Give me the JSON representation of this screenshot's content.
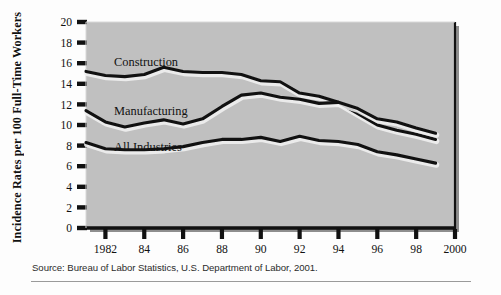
{
  "figure": {
    "background_color": "#fdfdfd",
    "plot_background_color": "#c0c0c0",
    "line_color": "#111111",
    "highlight_color": "#f2f2f2"
  },
  "y_axis": {
    "title": "Incidence Rates per 100 Full-Time Workers",
    "ticks": [
      "0",
      "2",
      "4",
      "6",
      "8",
      "10",
      "12",
      "14",
      "16",
      "18",
      "20"
    ]
  },
  "x_axis": {
    "ticks": [
      "1982",
      "84",
      "86",
      "88",
      "90",
      "92",
      "94",
      "96",
      "98",
      "2000"
    ]
  },
  "series_labels": {
    "construction": "Construction",
    "manufacturing": "Manufacturing",
    "all_industries": "All Industries"
  },
  "source": {
    "text": "Source: Bureau of Labor Statistics, U.S. Department of Labor, 2001."
  },
  "chart_data": {
    "type": "line",
    "title": "",
    "xlabel": "",
    "ylabel": "Incidence Rates per 100 Full-Time Workers",
    "xlim": [
      1981,
      2000
    ],
    "ylim": [
      0,
      20
    ],
    "ytick_step": 2,
    "xticks": [
      1982,
      1984,
      1986,
      1988,
      1990,
      1992,
      1994,
      1996,
      1998,
      2000
    ],
    "xtick_labels": [
      "1982",
      "84",
      "86",
      "88",
      "90",
      "92",
      "94",
      "96",
      "98",
      "2000"
    ],
    "grid": false,
    "legend": "inline-labels",
    "x": [
      1981,
      1982,
      1983,
      1984,
      1985,
      1986,
      1987,
      1988,
      1989,
      1990,
      1991,
      1992,
      1993,
      1994,
      1995,
      1996,
      1997,
      1998,
      1999
    ],
    "series": [
      {
        "name": "Construction",
        "label_position": "above-line-left",
        "values": [
          15.2,
          14.8,
          14.7,
          14.9,
          15.6,
          15.2,
          15.1,
          15.1,
          14.9,
          14.3,
          14.2,
          13.1,
          12.8,
          12.2,
          11.1,
          10.0,
          9.5,
          9.1,
          8.6
        ]
      },
      {
        "name": "Manufacturing",
        "label_position": "above-line-left",
        "values": [
          11.4,
          10.3,
          9.8,
          10.2,
          10.5,
          10.1,
          10.6,
          11.8,
          12.9,
          13.1,
          12.7,
          12.5,
          12.1,
          12.2,
          11.6,
          10.6,
          10.3,
          9.7,
          9.2
        ]
      },
      {
        "name": "All Industries",
        "label_position": "above-line-left",
        "values": [
          8.3,
          7.7,
          7.6,
          7.6,
          7.7,
          7.9,
          8.3,
          8.6,
          8.6,
          8.8,
          8.4,
          8.9,
          8.5,
          8.4,
          8.1,
          7.4,
          7.1,
          6.7,
          6.3
        ]
      }
    ]
  }
}
